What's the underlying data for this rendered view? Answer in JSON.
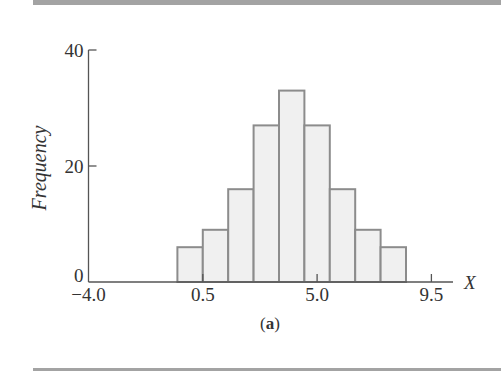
{
  "chart_data": {
    "type": "bar",
    "subtype": "histogram",
    "title": "",
    "caption": "(a)",
    "caption_label": "a",
    "xlabel": "X",
    "ylabel": "Frequency",
    "xlim": [
      -4.0,
      9.5
    ],
    "ylim": [
      0,
      40
    ],
    "x_ticks": [
      -4.0,
      0.5,
      5.0,
      9.5
    ],
    "x_tick_labels": [
      "−4.0",
      "0.5",
      "5.0",
      "9.5"
    ],
    "y_ticks": [
      0,
      20,
      40
    ],
    "y_tick_labels": [
      "0",
      "20",
      "40"
    ],
    "bins": [
      {
        "left": -0.5,
        "right": 0.5,
        "center": 0,
        "value": 6
      },
      {
        "left": 0.5,
        "right": 1.5,
        "center": 1,
        "value": 9
      },
      {
        "left": 1.5,
        "right": 2.5,
        "center": 2,
        "value": 16
      },
      {
        "left": 2.5,
        "right": 3.5,
        "center": 3,
        "value": 27
      },
      {
        "left": 3.5,
        "right": 4.5,
        "center": 4,
        "value": 33
      },
      {
        "left": 4.5,
        "right": 5.5,
        "center": 5,
        "value": 27
      },
      {
        "left": 5.5,
        "right": 6.5,
        "center": 6,
        "value": 16
      },
      {
        "left": 6.5,
        "right": 7.5,
        "center": 7,
        "value": 9
      },
      {
        "left": 7.5,
        "right": 8.5,
        "center": 8,
        "value": 6
      }
    ],
    "categories": [
      "0",
      "1",
      "2",
      "3",
      "4",
      "5",
      "6",
      "7",
      "8"
    ],
    "values": [
      6,
      9,
      16,
      27,
      33,
      27,
      16,
      9,
      6
    ],
    "grid": false,
    "legend": null,
    "colors": {
      "bar_fill": "#f0f0f0",
      "bar_edge": "#8c8c8c",
      "axis": "#555555",
      "text": "#333333",
      "rule": "#a3a3a3"
    }
  }
}
